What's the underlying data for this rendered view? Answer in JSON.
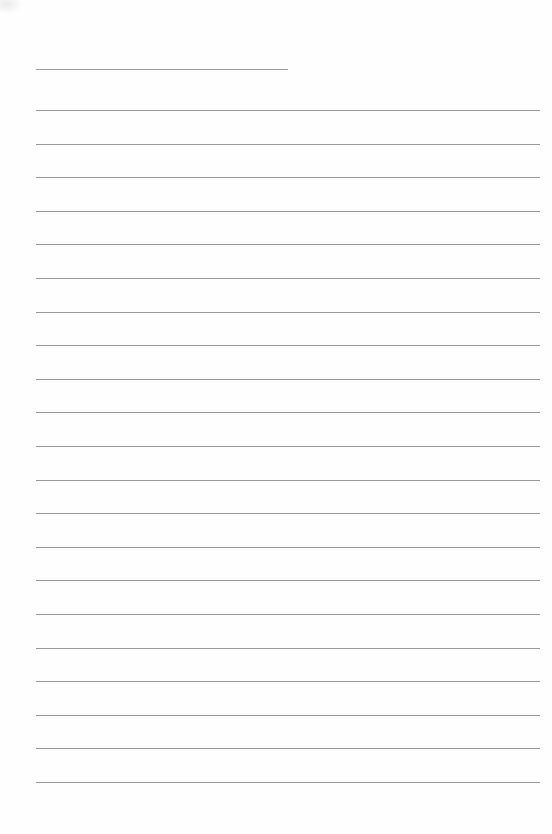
{
  "page": {
    "type": "lined-paper",
    "background_color": "#fefefe",
    "line_color": "#9a9a9a",
    "header_line": {
      "left": 36,
      "top": 69,
      "width": 252
    },
    "ruled_lines": {
      "count": 21,
      "left": 36,
      "width": 504,
      "first_top": 110,
      "spacing": 33.6
    }
  }
}
